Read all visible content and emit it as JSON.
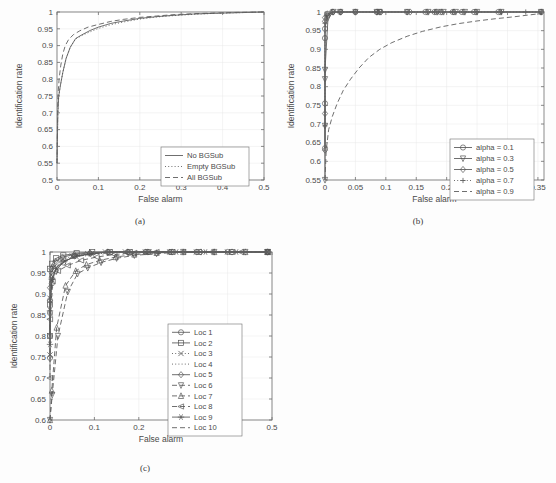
{
  "figure": {
    "background_color": "#fdfdfd",
    "axis_color": "#6e6e6e",
    "grid_color": "#e8e8e8",
    "text_color": "#4a4a4a",
    "curve_color": "#555555"
  },
  "panels": [
    {
      "id": "a",
      "caption": "(a)"
    },
    {
      "id": "b",
      "caption": "(b)"
    },
    {
      "id": "c",
      "caption": "(c)"
    }
  ],
  "chart_data": [
    {
      "panel": "a",
      "type": "line",
      "title": "",
      "xlabel": "False alarm",
      "ylabel": "Identification rate",
      "xlim": [
        0,
        0.5
      ],
      "ylim": [
        0.5,
        1
      ],
      "xticks": [
        "0",
        "0.1",
        "0.2",
        "0.3",
        "0.4",
        "0.5"
      ],
      "xtick_values": [
        0,
        0.1,
        0.2,
        0.3,
        0.4,
        0.5
      ],
      "yticks": [
        "0.5",
        "0.55",
        "0.6",
        "0.65",
        "0.7",
        "0.75",
        "0.8",
        "0.85",
        "0.9",
        "0.95",
        "1"
      ],
      "ytick_values": [
        0.5,
        0.55,
        0.6,
        0.65,
        0.7,
        0.75,
        0.8,
        0.85,
        0.9,
        0.95,
        1
      ],
      "grid": true,
      "legend_position": "lower-right",
      "series": [
        {
          "name": "No BGSub",
          "style": "solid",
          "marker": "none",
          "x": [
            0,
            0.002,
            0.004,
            0.008,
            0.014,
            0.022,
            0.032,
            0.045,
            0.06,
            0.08,
            0.1,
            0.13,
            0.16,
            0.2,
            0.24,
            0.28,
            0.33,
            0.38,
            0.44,
            0.5
          ],
          "y": [
            0.55,
            0.7,
            0.748,
            0.78,
            0.82,
            0.862,
            0.895,
            0.921,
            0.932,
            0.945,
            0.955,
            0.966,
            0.973,
            0.981,
            0.986,
            0.99,
            0.994,
            0.996,
            0.998,
            1.0
          ]
        },
        {
          "name": "Empty BGSub",
          "style": "dotted",
          "marker": "none",
          "x": [
            0,
            0.002,
            0.004,
            0.008,
            0.014,
            0.022,
            0.032,
            0.045,
            0.06,
            0.08,
            0.1,
            0.13,
            0.16,
            0.2,
            0.24,
            0.28,
            0.33,
            0.38,
            0.44,
            0.5
          ],
          "y": [
            0.55,
            0.7,
            0.748,
            0.78,
            0.82,
            0.862,
            0.895,
            0.92,
            0.93,
            0.941,
            0.951,
            0.962,
            0.97,
            0.979,
            0.985,
            0.989,
            0.993,
            0.996,
            0.998,
            1.0
          ]
        },
        {
          "name": "All BGSub",
          "style": "dashed",
          "marker": "none",
          "x": [
            0,
            0.002,
            0.005,
            0.009,
            0.014,
            0.02,
            0.028,
            0.04,
            0.055,
            0.075,
            0.1,
            0.13,
            0.16,
            0.2,
            0.24,
            0.28,
            0.33,
            0.38,
            0.44,
            0.5
          ],
          "y": [
            0.55,
            0.745,
            0.8,
            0.84,
            0.875,
            0.9,
            0.918,
            0.933,
            0.944,
            0.955,
            0.963,
            0.972,
            0.978,
            0.984,
            0.988,
            0.992,
            0.995,
            0.997,
            0.999,
            1.0
          ]
        }
      ]
    },
    {
      "panel": "b",
      "type": "line",
      "title": "",
      "xlabel": "False alarm",
      "ylabel": "Identification rate",
      "xlim": [
        0,
        0.36
      ],
      "ylim": [
        0.55,
        1
      ],
      "xticks": [
        "0",
        "0.05",
        "0.1",
        "0.15",
        "0.2",
        "0.25",
        "0.3",
        "0.35"
      ],
      "xtick_values": [
        0,
        0.05,
        0.1,
        0.15,
        0.2,
        0.25,
        0.3,
        0.35
      ],
      "yticks": [
        "0.55",
        "0.6",
        "0.65",
        "0.7",
        "0.75",
        "0.8",
        "0.85",
        "0.9",
        "0.95",
        "1"
      ],
      "ytick_values": [
        0.55,
        0.6,
        0.65,
        0.7,
        0.75,
        0.8,
        0.85,
        0.9,
        0.95,
        1
      ],
      "grid": true,
      "legend_position": "lower-right",
      "series": [
        {
          "name": "alpha = 0.1",
          "style": "solid",
          "marker": "circle",
          "x": [
            0,
            0,
            0,
            0,
            0.004,
            0.012,
            0.025,
            0.05,
            0.085,
            0.09,
            0.135,
            0.165,
            0.18,
            0.19,
            0.21,
            0.225,
            0.245,
            0.285,
            0.355
          ],
          "y": [
            0.635,
            0.755,
            0.93,
            0.955,
            0.99,
            1.0,
            1.0,
            1.0,
            1.0,
            1.0,
            1.0,
            1.0,
            1.0,
            1.0,
            1.0,
            1.0,
            1.0,
            1.0,
            1.0
          ]
        },
        {
          "name": "alpha = 0.3",
          "style": "solid",
          "marker": "triangle-down",
          "x": [
            0,
            0,
            0,
            0,
            0.005,
            0.014,
            0.025,
            0.05,
            0.085,
            0.09,
            0.135,
            0.17,
            0.185,
            0.195,
            0.215,
            0.23,
            0.25,
            0.29,
            0.355
          ],
          "y": [
            0.55,
            0.695,
            0.82,
            0.845,
            0.985,
            1.0,
            1.0,
            1.0,
            1.0,
            1.0,
            1.0,
            1.0,
            1.0,
            1.0,
            1.0,
            1.0,
            1.0,
            1.0,
            1.0
          ]
        },
        {
          "name": "alpha = 0.5",
          "style": "solid",
          "marker": "diamond",
          "x": [
            0,
            0,
            0,
            0,
            0.004,
            0.013,
            0.026,
            0.05,
            0.086,
            0.092,
            0.14,
            0.168,
            0.183,
            0.192,
            0.212,
            0.228,
            0.248,
            0.288,
            0.356
          ],
          "y": [
            0.63,
            0.728,
            0.975,
            0.985,
            0.995,
            1.0,
            1.0,
            1.0,
            1.0,
            1.0,
            1.0,
            1.0,
            1.0,
            1.0,
            1.0,
            1.0,
            1.0,
            1.0,
            1.0
          ]
        },
        {
          "name": "alpha = 0.7",
          "style": "dotted",
          "marker": "plus",
          "x": [
            0,
            0,
            0.003,
            0.012,
            0.026,
            0.05,
            0.086,
            0.135,
            0.18,
            0.21,
            0.25,
            0.29,
            0.33,
            0.356
          ],
          "y": [
            0.695,
            0.97,
            0.99,
            1.0,
            1.0,
            1.0,
            1.0,
            1.0,
            1.0,
            1.0,
            1.0,
            1.0,
            1.0,
            1.0
          ]
        },
        {
          "name": "alpha = 0.9",
          "style": "dashed",
          "marker": "none",
          "x": [
            0,
            0.002,
            0.006,
            0.012,
            0.02,
            0.03,
            0.042,
            0.056,
            0.072,
            0.09,
            0.11,
            0.135,
            0.16,
            0.19,
            0.22,
            0.25,
            0.28,
            0.31,
            0.335,
            0.356
          ],
          "y": [
            0.55,
            0.63,
            0.685,
            0.72,
            0.755,
            0.79,
            0.82,
            0.85,
            0.878,
            0.9,
            0.918,
            0.935,
            0.948,
            0.96,
            0.969,
            0.976,
            0.982,
            0.987,
            0.992,
            0.996
          ]
        }
      ]
    },
    {
      "panel": "c",
      "type": "line",
      "title": "",
      "xlabel": "False alarm",
      "ylabel": "Identification rate",
      "xlim": [
        0,
        0.5
      ],
      "ylim": [
        0.6,
        1
      ],
      "xticks": [
        "0",
        "0.1",
        "0.2",
        "0.3",
        "0.4",
        "0.5"
      ],
      "xtick_values": [
        0,
        0.1,
        0.2,
        0.3,
        0.4,
        0.5
      ],
      "yticks": [
        "0.6",
        "0.65",
        "0.7",
        "0.75",
        "0.8",
        "0.85",
        "0.9",
        "0.95",
        "1"
      ],
      "ytick_values": [
        0.6,
        0.65,
        0.7,
        0.75,
        0.8,
        0.85,
        0.9,
        0.95,
        1
      ],
      "grid": true,
      "legend_position": "right-middle",
      "series": [
        {
          "name": "Loc 1",
          "style": "solid",
          "marker": "circle",
          "x": [
            0,
            0,
            0,
            0.004,
            0.012,
            0.03,
            0.055,
            0.09,
            0.13,
            0.175,
            0.215,
            0.27,
            0.33,
            0.4,
            0.49
          ],
          "y": [
            0.748,
            0.855,
            0.885,
            0.925,
            0.955,
            0.975,
            0.99,
            0.996,
            1.0,
            1.0,
            1.0,
            1.0,
            1.0,
            1.0,
            1.0
          ]
        },
        {
          "name": "Loc 2",
          "style": "solid",
          "marker": "square",
          "x": [
            0,
            0,
            0,
            0.005,
            0.014,
            0.03,
            0.06,
            0.095,
            0.135,
            0.18,
            0.22,
            0.275,
            0.335,
            0.41,
            0.49
          ],
          "y": [
            0.8,
            0.875,
            0.96,
            0.972,
            0.985,
            0.992,
            0.997,
            1.0,
            1.0,
            1.0,
            1.0,
            1.0,
            1.0,
            1.0,
            1.0
          ]
        },
        {
          "name": "Loc 3",
          "style": "dotted",
          "marker": "x",
          "x": [
            0,
            0,
            0.003,
            0.01,
            0.025,
            0.05,
            0.085,
            0.125,
            0.17,
            0.215,
            0.27,
            0.33,
            0.4,
            0.49
          ],
          "y": [
            0.755,
            0.89,
            0.945,
            0.965,
            0.98,
            0.99,
            0.996,
            1.0,
            1.0,
            1.0,
            1.0,
            1.0,
            1.0,
            1.0
          ]
        },
        {
          "name": "Loc 4",
          "style": "dotted",
          "marker": "none",
          "x": [
            0,
            0.002,
            0.008,
            0.02,
            0.04,
            0.07,
            0.11,
            0.155,
            0.2,
            0.26,
            0.32,
            0.39,
            0.49
          ],
          "y": [
            0.73,
            0.9,
            0.95,
            0.972,
            0.984,
            0.992,
            0.996,
            1.0,
            1.0,
            1.0,
            1.0,
            1.0,
            1.0
          ]
        },
        {
          "name": "Loc 5",
          "style": "solid",
          "marker": "diamond",
          "x": [
            0,
            0,
            0.003,
            0.012,
            0.028,
            0.055,
            0.09,
            0.13,
            0.175,
            0.22,
            0.275,
            0.34,
            0.41,
            0.49
          ],
          "y": [
            0.8,
            0.915,
            0.96,
            0.978,
            0.988,
            0.994,
            0.998,
            1.0,
            1.0,
            1.0,
            1.0,
            1.0,
            1.0,
            1.0
          ]
        },
        {
          "name": "Loc 6",
          "style": "dashed",
          "marker": "triangle-down",
          "x": [
            0,
            0.005,
            0.018,
            0.04,
            0.062,
            0.085,
            0.115,
            0.15,
            0.19,
            0.24,
            0.3,
            0.37,
            0.44,
            0.49
          ],
          "y": [
            0.6,
            0.66,
            0.8,
            0.905,
            0.948,
            0.962,
            0.975,
            0.985,
            0.992,
            0.996,
            1.0,
            1.0,
            1.0,
            1.0
          ]
        },
        {
          "name": "Loc 7",
          "style": "dashed",
          "marker": "triangle-up",
          "x": [
            0,
            0.004,
            0.015,
            0.035,
            0.058,
            0.082,
            0.112,
            0.148,
            0.19,
            0.24,
            0.3,
            0.37,
            0.44,
            0.49
          ],
          "y": [
            0.6,
            0.67,
            0.82,
            0.92,
            0.955,
            0.97,
            0.98,
            0.988,
            0.994,
            0.998,
            1.0,
            1.0,
            1.0,
            1.0
          ]
        },
        {
          "name": "Loc 8",
          "style": "dashed",
          "marker": "triangle-left",
          "x": [
            0,
            0,
            0.006,
            0.018,
            0.04,
            0.07,
            0.105,
            0.145,
            0.19,
            0.24,
            0.3,
            0.365,
            0.43,
            0.49
          ],
          "y": [
            0.7,
            0.84,
            0.93,
            0.955,
            0.968,
            0.98,
            0.988,
            0.994,
            0.998,
            1.0,
            1.0,
            1.0,
            1.0,
            1.0
          ]
        },
        {
          "name": "Loc 9",
          "style": "solid",
          "marker": "star",
          "x": [
            0,
            0,
            0.004,
            0.014,
            0.032,
            0.06,
            0.095,
            0.135,
            0.18,
            0.225,
            0.285,
            0.35,
            0.42,
            0.49
          ],
          "y": [
            0.78,
            0.86,
            0.935,
            0.962,
            0.978,
            0.99,
            0.996,
            1.0,
            1.0,
            1.0,
            1.0,
            1.0,
            1.0,
            1.0
          ]
        },
        {
          "name": "Loc 10",
          "style": "dashed",
          "marker": "none",
          "x": [
            0,
            0,
            0.005,
            0.016,
            0.035,
            0.065,
            0.1,
            0.14,
            0.185,
            0.235,
            0.295,
            0.36,
            0.43,
            0.49
          ],
          "y": [
            0.76,
            0.88,
            0.94,
            0.965,
            0.98,
            0.99,
            0.996,
            1.0,
            1.0,
            1.0,
            1.0,
            1.0,
            1.0,
            1.0
          ]
        }
      ]
    }
  ]
}
